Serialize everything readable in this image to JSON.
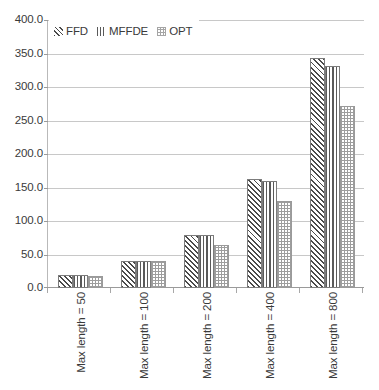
{
  "chart_data": {
    "type": "bar",
    "title": "",
    "subtitle": "",
    "xlabel": "",
    "ylabel": "",
    "categories": [
      "Max length = 50",
      "Max length = 100",
      "Max length = 200",
      "Max length = 400",
      "Max length = 800"
    ],
    "series": [
      {
        "name": "FFD",
        "pattern": "diagonal-hatch",
        "values": [
          20,
          41,
          80,
          163,
          345
        ]
      },
      {
        "name": "MFFDE",
        "pattern": "vertical-lines",
        "values": [
          20,
          41,
          80,
          160,
          333
        ]
      },
      {
        "name": "OPT",
        "pattern": "checker",
        "values": [
          18,
          40,
          65,
          131,
          272
        ]
      }
    ],
    "ylim": [
      0,
      400
    ],
    "ytick_step": 50,
    "ytick_labels": [
      "0.0",
      "50.0",
      "100.0",
      "150.0",
      "200.0",
      "250.0",
      "300.0",
      "350.0",
      "400.0"
    ],
    "grid": true,
    "legend_position": "top-left",
    "colors": {
      "background": "#ffffff",
      "gridline": "#c8c8c8",
      "axis": "#9a9a9a",
      "text": "#3a3a3a",
      "ffd": "#4a4a4a",
      "mffde": "#5a5a5a",
      "opt": "#9d9d9d"
    }
  },
  "legend": {
    "items": [
      {
        "label": "FFD"
      },
      {
        "label": "MFFDE"
      },
      {
        "label": "OPT"
      }
    ]
  }
}
